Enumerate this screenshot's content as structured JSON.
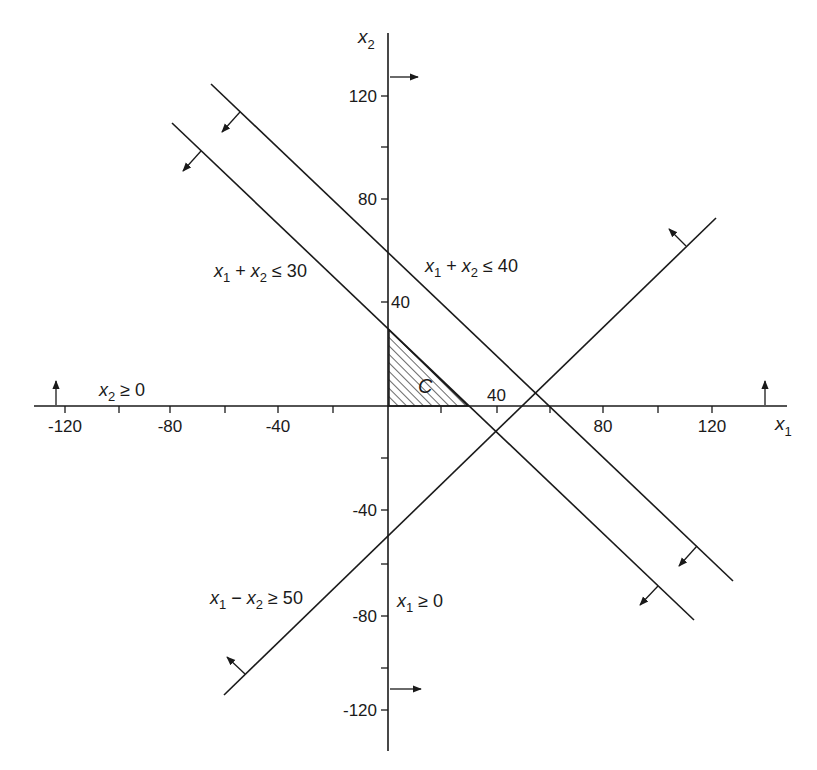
{
  "figure": {
    "axes": {
      "x_label": "x",
      "x_label_sub": "1",
      "y_label": "x",
      "y_label_sub": "2",
      "x_ticks": [
        {
          "value": -120,
          "label": "-120",
          "px": 65
        },
        {
          "value": -100,
          "label": "",
          "px": 119
        },
        {
          "value": -80,
          "label": "-80",
          "px": 170
        },
        {
          "value": -60,
          "label": "",
          "px": 225
        },
        {
          "value": -40,
          "label": "-40",
          "px": 278
        },
        {
          "value": -20,
          "label": "",
          "px": 333
        },
        {
          "value": 20,
          "label": "",
          "px": 441
        },
        {
          "value": 40,
          "label": "40",
          "px": 497
        },
        {
          "value": 60,
          "label": "",
          "px": 550
        },
        {
          "value": 80,
          "label": "80",
          "px": 603
        },
        {
          "value": 100,
          "label": "",
          "px": 658
        },
        {
          "value": 120,
          "label": "120",
          "px": 712
        }
      ],
      "y_ticks": [
        {
          "value": 120,
          "label": "120",
          "px": 96
        },
        {
          "value": 100,
          "label": "",
          "px": 147
        },
        {
          "value": 80,
          "label": "80",
          "px": 199
        },
        {
          "value": 40,
          "label": "40",
          "px": 302
        },
        {
          "value": -20,
          "label": "",
          "px": 458
        },
        {
          "value": -40,
          "label": "-40",
          "px": 510
        },
        {
          "value": -60,
          "label": "",
          "px": 564
        },
        {
          "value": -80,
          "label": "-80",
          "px": 616
        },
        {
          "value": -100,
          "label": "",
          "px": 668
        },
        {
          "value": -120,
          "label": "-120",
          "px": 710
        }
      ]
    },
    "constraints": [
      {
        "id": "c1",
        "text_a": "x",
        "sub_a": "1",
        "op": " + ",
        "text_b": "x",
        "sub_b": "2",
        "rel": " ≤ 30"
      },
      {
        "id": "c2",
        "text_a": "x",
        "sub_a": "1",
        "op": " + ",
        "text_b": "x",
        "sub_b": "2",
        "rel": " ≤ 40"
      },
      {
        "id": "c3",
        "text_a": "x",
        "sub_a": "1",
        "op": " − ",
        "text_b": "x",
        "sub_b": "2",
        "rel": " ≥ 50"
      },
      {
        "id": "c4",
        "text_a": "x",
        "sub_a": "1",
        "rel": " ≥ 0"
      },
      {
        "id": "c5",
        "text_a": "x",
        "sub_a": "2",
        "rel": " ≥ 0"
      }
    ],
    "feasible_region": {
      "label": "C"
    },
    "colors": {
      "ink": "#1a1a1a",
      "background": "#ffffff"
    }
  }
}
